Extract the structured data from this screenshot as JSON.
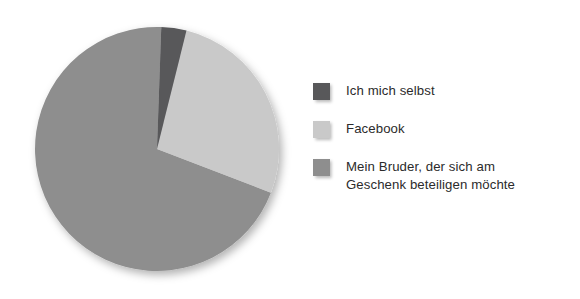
{
  "chart_data": {
    "type": "pie",
    "title": "",
    "subtitle": "",
    "xlabel": "",
    "ylabel": "",
    "grid": false,
    "legend_position": "right",
    "categories": [
      "Ich mich selbst",
      "Facebook",
      "Mein Bruder, der sich am Geschenk beteiligen möchte"
    ],
    "values": [
      3.5,
      27,
      69.5
    ],
    "slices": [
      {
        "label": "Ich mich selbst",
        "value": 3.5,
        "color": "#58585a",
        "start_angle_deg": 2,
        "end_angle_deg": 14
      },
      {
        "label": "Facebook",
        "value": 27,
        "color": "#c9c9c9",
        "start_angle_deg": 14,
        "end_angle_deg": 111
      },
      {
        "label": "Mein Bruder, der sich am\nGeschenk beteiligen möchte",
        "value": 69.5,
        "color": "#8e8e8e",
        "start_angle_deg": 111,
        "end_angle_deg": 362
      }
    ]
  },
  "legend": {
    "items": [
      {
        "label": "Ich mich selbst",
        "color": "#58585a"
      },
      {
        "label": "Facebook",
        "color": "#c9c9c9"
      },
      {
        "label": "Mein Bruder, der sich am\nGeschenk beteiligen möchte",
        "color": "#8e8e8e"
      }
    ]
  },
  "colors": {
    "background": "#ffffff",
    "text": "#2b2b2b",
    "slice_dark": "#58585a",
    "slice_light": "#c9c9c9",
    "slice_medium": "#8e8e8e"
  }
}
